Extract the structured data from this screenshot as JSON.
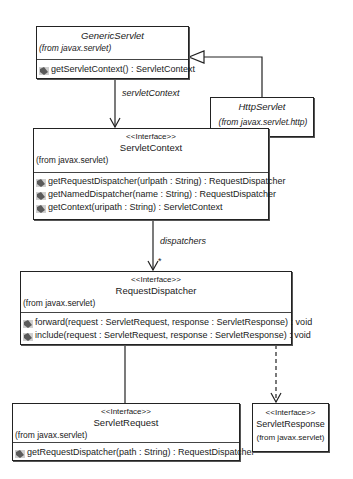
{
  "diagram": {
    "type": "uml-class-diagram",
    "classes": [
      {
        "id": "GenericServlet",
        "name": "GenericServlet",
        "stereotype": "",
        "from": "(from javax.servlet)",
        "operations": [
          "getServletContext() : ServletContext"
        ]
      },
      {
        "id": "HttpServlet",
        "name": "HttpServlet",
        "stereotype": "",
        "from": "(from javax.servlet.http)",
        "operations": []
      },
      {
        "id": "ServletContext",
        "name": "ServletContext",
        "stereotype": "<<Interface>>",
        "from": "(from javax.servlet)",
        "operations": [
          "getRequestDispatcher(urlpath : String) : RequestDispatcher",
          "getNamedDispatcher(name : String) : RequestDispatcher",
          "getContext(uripath : String) : ServletContext"
        ]
      },
      {
        "id": "RequestDispatcher",
        "name": "RequestDispatcher",
        "stereotype": "<<Interface>>",
        "from": "(from javax.servlet)",
        "operations": [
          "forward(request : ServletRequest, response : ServletResponse) : void",
          "include(request : ServletRequest, response : ServletResponse) : void"
        ]
      },
      {
        "id": "ServletRequest",
        "name": "ServletRequest",
        "stereotype": "<<Interface>>",
        "from": "(from javax.servlet)",
        "operations": [
          "getRequestDispatcher(path : String) : RequestDispatcher"
        ]
      },
      {
        "id": "ServletResponse",
        "name": "ServletResponse",
        "stereotype": "<<Interface>>",
        "from": "(from javax.servlet)",
        "operations": []
      }
    ],
    "relationships": [
      {
        "from": "HttpServlet",
        "to": "GenericServlet",
        "kind": "generalization"
      },
      {
        "from": "GenericServlet",
        "to": "ServletContext",
        "kind": "association",
        "label": "servletContext"
      },
      {
        "from": "ServletContext",
        "to": "RequestDispatcher",
        "kind": "association",
        "label": "dispatchers",
        "multiplicity": "*"
      },
      {
        "from": "RequestDispatcher",
        "to": "ServletRequest",
        "kind": "association"
      },
      {
        "from": "RequestDispatcher",
        "to": "ServletResponse",
        "kind": "dependency"
      }
    ]
  },
  "colors": {
    "line": "#222222",
    "icon": "#6a6a6a",
    "background": "#ffffff"
  }
}
